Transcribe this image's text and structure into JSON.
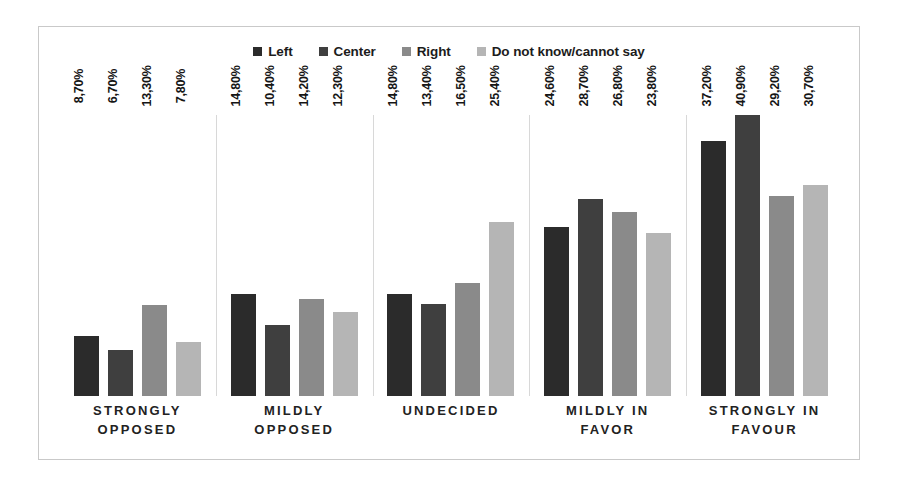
{
  "chart_data": {
    "type": "bar",
    "title": "",
    "subtitle": "",
    "xlabel": "",
    "ylabel": "",
    "ylim": [
      0,
      45
    ],
    "grid": false,
    "legend_position": "top-center",
    "value_label_format": "comma-decimal-percent",
    "categories": [
      "STRONGLY OPPOSED",
      "MILDLY OPPOSED",
      "UNDECIDED",
      "MILDLY IN FAVOR",
      "STRONGLY IN FAVOUR"
    ],
    "category_lines": [
      [
        "STRONGLY",
        "OPPOSED"
      ],
      [
        "MILDLY",
        "OPPOSED"
      ],
      [
        "UNDECIDED"
      ],
      [
        "MILDLY IN",
        "FAVOR"
      ],
      [
        "STRONGLY IN",
        "FAVOUR"
      ]
    ],
    "series": [
      {
        "name": "Left",
        "color": "#2b2b2b",
        "values": [
          8.7,
          14.8,
          14.8,
          24.6,
          37.2
        ],
        "labels": [
          "8,70%",
          "14,80%",
          "14,80%",
          "24,60%",
          "37,20%"
        ]
      },
      {
        "name": "Center",
        "color": "#3f3f3f",
        "values": [
          6.7,
          10.4,
          13.4,
          28.7,
          40.9
        ],
        "labels": [
          "6,70%",
          "10,40%",
          "13,40%",
          "28,70%",
          "40,90%"
        ]
      },
      {
        "name": "Right",
        "color": "#8a8a8a",
        "values": [
          13.3,
          14.2,
          16.5,
          26.8,
          29.2
        ],
        "labels": [
          "13,30%",
          "14,20%",
          "16,50%",
          "26,80%",
          "29,20%"
        ]
      },
      {
        "name": "Do not know/cannot say",
        "color": "#b5b5b5",
        "values": [
          7.8,
          12.3,
          25.4,
          23.8,
          30.7
        ],
        "labels": [
          "7,80%",
          "12,30%",
          "25,40%",
          "23,80%",
          "30,70%"
        ]
      }
    ]
  },
  "legend": {
    "items": [
      {
        "label": "Left",
        "color": "#2b2b2b"
      },
      {
        "label": "Center",
        "color": "#3f3f3f"
      },
      {
        "label": "Right",
        "color": "#8a8a8a"
      },
      {
        "label": "Do not know/cannot say",
        "color": "#b5b5b5"
      }
    ]
  }
}
